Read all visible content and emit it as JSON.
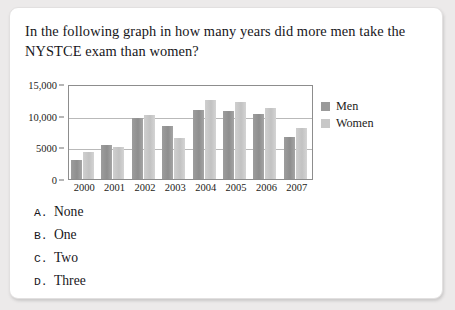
{
  "question": {
    "text": "In the following graph in how many years did more men take the NYSTCE exam than women?"
  },
  "options": [
    {
      "key": "A.",
      "label": "None"
    },
    {
      "key": "B.",
      "label": "One"
    },
    {
      "key": "C.",
      "label": "Two"
    },
    {
      "key": "D.",
      "label": "Three"
    }
  ],
  "legend": [
    {
      "label": "Men",
      "color": "#9a9a9a"
    },
    {
      "label": "Women",
      "color": "#c8c8c8"
    }
  ],
  "chart_data": {
    "type": "bar",
    "title": "",
    "xlabel": "",
    "ylabel": "",
    "categories": [
      "2000",
      "2001",
      "2002",
      "2003",
      "2004",
      "2005",
      "2006",
      "2007"
    ],
    "series": [
      {
        "name": "Men",
        "color": "#9a9a9a",
        "values": [
          3000,
          5500,
          9800,
          8500,
          11200,
          11000,
          10500,
          6700
        ]
      },
      {
        "name": "Women",
        "color": "#c8c8c8",
        "values": [
          4400,
          5200,
          10400,
          6600,
          12700,
          12500,
          11400,
          8200
        ]
      }
    ],
    "ylim": [
      0,
      15000
    ],
    "yticks": [
      0,
      5000,
      10000,
      15000
    ],
    "ytick_labels": [
      "0",
      "5000",
      "10,000",
      "15,000"
    ],
    "grid": true,
    "legend_position": "right"
  }
}
